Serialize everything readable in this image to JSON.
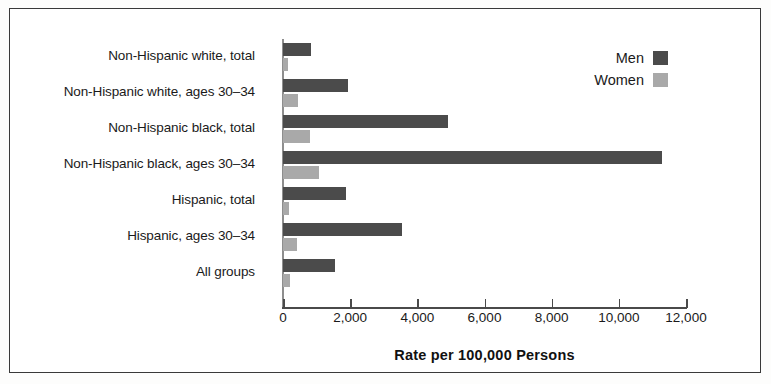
{
  "chart_data": {
    "type": "bar",
    "orientation": "horizontal",
    "title": "",
    "xlabel": "Rate per 100,000 Persons",
    "ylabel": "",
    "xlim": [
      0,
      12000
    ],
    "xticks": [
      0,
      2000,
      4000,
      6000,
      8000,
      10000,
      12000
    ],
    "xticklabels": [
      "0",
      "2,000",
      "4,000",
      "6,000",
      "8,000",
      "10,000",
      "12,000"
    ],
    "grid": false,
    "legend_position": "top-right",
    "categories": [
      "Non-Hispanic white, total",
      "Non-Hispanic white, ages 30–34",
      "Non-Hispanic black, total",
      "Non-Hispanic black, ages 30–34",
      "Hispanic, total",
      "Hispanic, ages 30–34",
      "All groups"
    ],
    "series": [
      {
        "name": "Men",
        "color": "#4b4b4b",
        "values": [
          830,
          1930,
          4900,
          11300,
          1870,
          3540,
          1540
        ]
      },
      {
        "name": "Women",
        "color": "#a9a9a9",
        "values": [
          150,
          450,
          800,
          1060,
          180,
          420,
          210
        ]
      }
    ]
  },
  "legend": {
    "items": [
      {
        "label": "Men",
        "color": "#4b4b4b"
      },
      {
        "label": "Women",
        "color": "#a9a9a9"
      }
    ]
  },
  "axis": {
    "title": "Rate per 100,000 Persons"
  }
}
